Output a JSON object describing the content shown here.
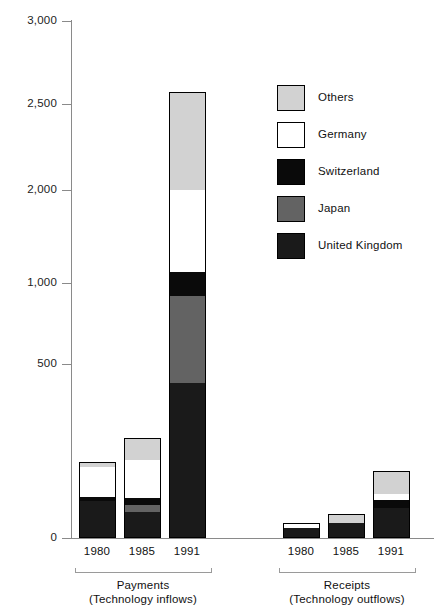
{
  "chart_data": {
    "type": "bar",
    "subtype": "stacked-bar",
    "title": "",
    "xlabel": "",
    "ylabel": "",
    "grid": false,
    "ylim": [
      0,
      3000
    ],
    "y_axis_note": "non-linear / broken axis spacing",
    "yticks": [
      {
        "value": 0,
        "label": "0",
        "y": 538
      },
      {
        "value": 500,
        "label": "500",
        "y": 364
      },
      {
        "value": 1000,
        "label": "1,000",
        "y": 283
      },
      {
        "value": 2000,
        "label": "2,000",
        "y": 190
      },
      {
        "value": 2500,
        "label": "2,500",
        "y": 104
      },
      {
        "value": 3000,
        "label": "3,000",
        "y": 21
      }
    ],
    "categories": [
      "1980",
      "1985",
      "1991",
      "1980",
      "1985",
      "1991"
    ],
    "groups": [
      {
        "name": "payments",
        "label": "Payments",
        "sublabel": "(Technology inflows)",
        "categories": [
          "1980",
          "1985",
          "1991"
        ]
      },
      {
        "name": "receipts",
        "label": "Receipts",
        "sublabel": "(Technology outflows)",
        "categories": [
          "1980",
          "1985",
          "1991"
        ]
      }
    ],
    "series": [
      {
        "name": "United Kingdom",
        "color": "#1a1a1a",
        "values": [
          135,
          108,
          390,
          18,
          38,
          110
        ]
      },
      {
        "name": "Japan",
        "color": "#636363",
        "values": [
          0,
          26,
          500,
          0,
          0,
          0
        ]
      },
      {
        "name": "Switzerland",
        "color": "#0a0a0a",
        "values": [
          13,
          27,
          140,
          0,
          0,
          30
        ]
      },
      {
        "name": "Germany",
        "color": "#ffffff",
        "values": [
          48,
          140,
          470,
          12,
          0,
          22
        ]
      },
      {
        "name": "Others",
        "color": "#d2d2d2",
        "values": [
          10,
          82,
          1090,
          0,
          32,
          125
        ]
      }
    ],
    "stack_order_bottom_to_top": [
      "United Kingdom",
      "Japan",
      "Switzerland",
      "Germany",
      "Others"
    ],
    "bar_totals": [
      206,
      383,
      2590,
      30,
      70,
      287
    ],
    "legend": {
      "position": "right",
      "entries": [
        {
          "label": "Others",
          "color": "#d2d2d2"
        },
        {
          "label": "Germany",
          "color": "#ffffff"
        },
        {
          "label": "Switzerland",
          "color": "#0a0a0a"
        },
        {
          "label": "Japan",
          "color": "#636363"
        },
        {
          "label": "United Kingdom",
          "color": "#1a1a1a"
        }
      ]
    },
    "bars_pixels": [
      {
        "group": "payments",
        "category": "1980",
        "x": 79,
        "segments": [
          {
            "series": "United Kingdom",
            "color": "#1a1a1a",
            "top": 501,
            "bottom": 538
          },
          {
            "series": "Switzerland",
            "color": "#0a0a0a",
            "top": 497,
            "bottom": 501
          },
          {
            "series": "Germany",
            "color": "#ffffff",
            "top": 467,
            "bottom": 497
          },
          {
            "series": "Others",
            "color": "#d2d2d2",
            "top": 462,
            "bottom": 467
          }
        ]
      },
      {
        "group": "payments",
        "category": "1985",
        "x": 124,
        "segments": [
          {
            "series": "United Kingdom",
            "color": "#1a1a1a",
            "top": 512,
            "bottom": 538
          },
          {
            "series": "Japan",
            "color": "#636363",
            "top": 505,
            "bottom": 512
          },
          {
            "series": "Switzerland",
            "color": "#0a0a0a",
            "top": 498,
            "bottom": 505
          },
          {
            "series": "Germany",
            "color": "#ffffff",
            "top": 460,
            "bottom": 498
          },
          {
            "series": "Others",
            "color": "#d2d2d2",
            "top": 438,
            "bottom": 460
          }
        ]
      },
      {
        "group": "payments",
        "category": "1991",
        "x": 169,
        "segments": [
          {
            "series": "United Kingdom",
            "color": "#1a1a1a",
            "top": 383,
            "bottom": 538
          },
          {
            "series": "Japan",
            "color": "#636363",
            "top": 296,
            "bottom": 383
          },
          {
            "series": "Switzerland",
            "color": "#0a0a0a",
            "top": 272,
            "bottom": 296
          },
          {
            "series": "Germany",
            "color": "#ffffff",
            "top": 190,
            "bottom": 272
          },
          {
            "series": "Others",
            "color": "#d2d2d2",
            "top": 92,
            "bottom": 190
          }
        ]
      },
      {
        "group": "receipts",
        "category": "1980",
        "x": 283,
        "segments": [
          {
            "series": "United Kingdom",
            "color": "#1a1a1a",
            "top": 528,
            "bottom": 538
          },
          {
            "series": "Germany",
            "color": "#ffffff",
            "top": 523,
            "bottom": 528
          }
        ]
      },
      {
        "group": "receipts",
        "category": "1985",
        "x": 328,
        "segments": [
          {
            "series": "United Kingdom",
            "color": "#1a1a1a",
            "top": 523,
            "bottom": 538
          },
          {
            "series": "Others",
            "color": "#d2d2d2",
            "top": 514,
            "bottom": 523
          }
        ]
      },
      {
        "group": "receipts",
        "category": "1991",
        "x": 373,
        "segments": [
          {
            "series": "United Kingdom",
            "color": "#1a1a1a",
            "top": 508,
            "bottom": 538
          },
          {
            "series": "Switzerland",
            "color": "#0a0a0a",
            "top": 500,
            "bottom": 508
          },
          {
            "series": "Germany",
            "color": "#ffffff",
            "top": 494,
            "bottom": 500
          },
          {
            "series": "Others",
            "color": "#d2d2d2",
            "top": 471,
            "bottom": 494
          }
        ]
      }
    ]
  }
}
